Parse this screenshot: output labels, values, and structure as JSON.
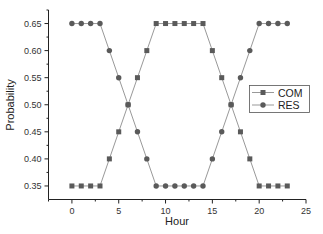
{
  "chart_data": {
    "type": "line",
    "title": "",
    "xlabel": "Hour",
    "ylabel": "Probability",
    "xlim": [
      -2.5,
      25
    ],
    "ylim": [
      0.325,
      0.675
    ],
    "x_ticks": [
      0,
      5,
      10,
      15,
      20,
      25
    ],
    "x_tick_labels": [
      "0",
      "5",
      "10",
      "15",
      "20",
      "25"
    ],
    "y_ticks": [
      0.35,
      0.4,
      0.45,
      0.5,
      0.55,
      0.6,
      0.65
    ],
    "y_tick_labels": [
      "0.35",
      "0.40",
      "0.45",
      "0.50",
      "0.55",
      "0.60",
      "0.65"
    ],
    "grid": false,
    "legend_position": "right-middle",
    "x": [
      0,
      1,
      2,
      3,
      4,
      5,
      6,
      7,
      8,
      9,
      10,
      11,
      12,
      13,
      14,
      15,
      16,
      17,
      18,
      19,
      20,
      21,
      22,
      23
    ],
    "series": [
      {
        "name": "COM",
        "marker": "square",
        "values": [
          0.35,
          0.35,
          0.35,
          0.35,
          0.4,
          0.45,
          0.5,
          0.55,
          0.6,
          0.65,
          0.65,
          0.65,
          0.65,
          0.65,
          0.65,
          0.6,
          0.55,
          0.5,
          0.45,
          0.4,
          0.35,
          0.35,
          0.35,
          0.35
        ]
      },
      {
        "name": "RES",
        "marker": "circle",
        "values": [
          0.65,
          0.65,
          0.65,
          0.65,
          0.6,
          0.55,
          0.5,
          0.45,
          0.4,
          0.35,
          0.35,
          0.35,
          0.35,
          0.35,
          0.35,
          0.4,
          0.45,
          0.5,
          0.55,
          0.6,
          0.65,
          0.65,
          0.65,
          0.65
        ]
      }
    ]
  },
  "colors": {
    "line": "#999999",
    "marker": "#5a5a5a",
    "axis": "#222222"
  },
  "legend": {
    "items": [
      {
        "label": "COM",
        "marker": "square"
      },
      {
        "label": "RES",
        "marker": "circle"
      }
    ]
  }
}
